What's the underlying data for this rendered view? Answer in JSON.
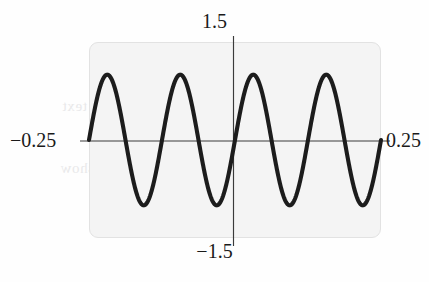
{
  "figure": {
    "kind": "graphing-calculator-plot-window",
    "background_color": "#fefefe",
    "plot_fill_color": "#f4f4f4",
    "plot_border_color": "#e2e2e2",
    "axis_color": "#3a3a3a",
    "curve_color": "#1c1c1c",
    "bleed_text": {
      "line1": "bleed-through text",
      "line2": "reverse page show",
      "line3": "faint"
    }
  },
  "labels": {
    "y_max": "1.5",
    "y_min": "−1.5",
    "x_min": "−0.25",
    "x_max": "0.25"
  },
  "chart_data": {
    "type": "line",
    "title": "",
    "xlabel": "",
    "ylabel": "",
    "xlim": [
      -0.25,
      0.25
    ],
    "ylim": [
      -1.5,
      1.5
    ],
    "xticks": [
      -0.25,
      0.25
    ],
    "yticks": [
      -1.5,
      1.5
    ],
    "xtick_labels": [
      "−0.25",
      "0.25"
    ],
    "ytick_labels": [
      "−1.5",
      "1.5"
    ],
    "grid": false,
    "legend": null,
    "axes_drawn": [
      "x-axis at y=0",
      "y-axis at x=0"
    ],
    "series": [
      {
        "name": "sinusoid",
        "description": "sine wave, amplitude 1, about 4 full cycles across the window, rising through zero at x=0",
        "amplitude": 1.0,
        "cycles_in_window": 4,
        "phase": "rising-through-zero-at-x=0",
        "approx_period": 0.125,
        "peak_value": 1.0,
        "trough_value": -1.0,
        "x": [
          -0.25,
          -0.2344,
          -0.2188,
          -0.2031,
          -0.1875,
          -0.1719,
          -0.1563,
          -0.1406,
          -0.125,
          -0.1094,
          -0.0938,
          -0.0781,
          -0.0625,
          -0.0469,
          -0.0313,
          -0.0156,
          0.0,
          0.0156,
          0.0313,
          0.0469,
          0.0625,
          0.0781,
          0.0938,
          0.1094,
          0.125,
          0.1406,
          0.1563,
          0.1719,
          0.1875,
          0.2031,
          0.2188,
          0.2344,
          0.25
        ],
        "values": [
          0.0,
          0.7071,
          1.0,
          0.7071,
          0.0,
          -0.7071,
          -1.0,
          -0.7071,
          0.0,
          0.7071,
          1.0,
          0.7071,
          0.0,
          -0.7071,
          -1.0,
          -0.7071,
          0.0,
          0.7071,
          1.0,
          0.7071,
          0.0,
          -0.7071,
          -1.0,
          -0.7071,
          0.0,
          0.7071,
          1.0,
          0.7071,
          0.0,
          -0.7071,
          -1.0,
          -0.7071,
          0.0
        ]
      }
    ]
  }
}
